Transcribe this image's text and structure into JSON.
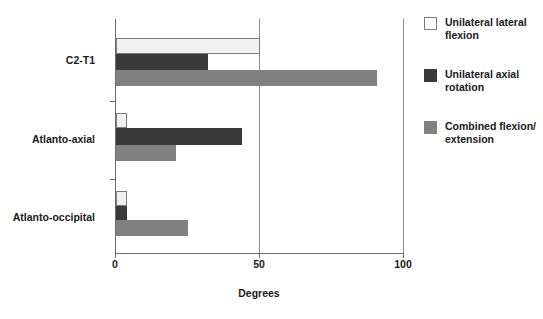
{
  "chart_data": {
    "type": "bar",
    "orientation": "horizontal",
    "title": "",
    "xlabel": "Degrees",
    "ylabel": "",
    "xlim": [
      0,
      100
    ],
    "xticks": [
      0,
      50,
      100
    ],
    "xtick_labels": [
      "0",
      "50",
      "100"
    ],
    "grid": "vertical gridline at 50",
    "legend_position": "right",
    "categories": [
      "C2-T1",
      "Atlanto-axial",
      "Atlanto-occipital"
    ],
    "series": [
      {
        "name": "Unilateral lateral flexion",
        "color": "#f1f1f1",
        "values": [
          50,
          4,
          4
        ]
      },
      {
        "name": "Unilateral axial rotation",
        "color": "#3a3a3a",
        "values": [
          32,
          44,
          4
        ]
      },
      {
        "name": "Combined flexion/extension",
        "color": "#808080",
        "values": [
          91,
          21,
          25
        ]
      }
    ]
  },
  "axes": {
    "x_title": "Degrees",
    "tick_0": "0",
    "tick_50": "50",
    "tick_100": "100"
  },
  "categories": {
    "c0": "C2-T1",
    "c1": "Atlanto-axial",
    "c2": "Atlanto-occipital"
  },
  "legend": {
    "item0_line1": "Unilateral lateral",
    "item0_line2": "flexion",
    "item1_line1": "Unilateral axial",
    "item1_line2": "rotation",
    "item2_line1": "Combined flexion/",
    "item2_line2": "extension"
  }
}
